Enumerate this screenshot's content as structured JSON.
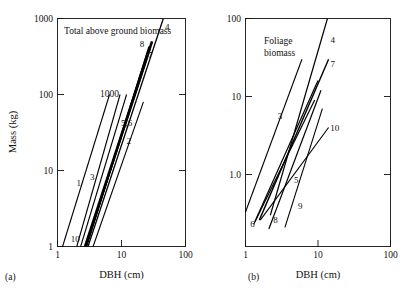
{
  "figure": {
    "panels": [
      {
        "tag": "(a)",
        "annotation": "Total above ground biomass",
        "extra_annotation": "1000",
        "xlabel": "DBH (cm)",
        "ylabel": "Mass (kg)",
        "xticks": [
          "1",
          "10",
          "100"
        ],
        "yticks": [
          "1000",
          "100",
          "10",
          "1"
        ]
      },
      {
        "tag": "(b)",
        "annotation_line1": "Foliage",
        "annotation_line2": "biomass",
        "xlabel": "DBH (cm)",
        "xticks": [
          "1",
          "10",
          "100"
        ],
        "yticks": [
          "100",
          "10",
          "1.0"
        ]
      }
    ]
  },
  "chart_data": [
    {
      "type": "line",
      "panel": "(a)",
      "title": "Total above ground biomass",
      "xlabel": "DBH (cm)",
      "ylabel": "Mass (kg)",
      "xscale": "log",
      "yscale": "log",
      "xlim": [
        1,
        100
      ],
      "ylim": [
        1,
        1000
      ],
      "grid": false,
      "legend": "inline-numeric-labels",
      "annotations": [
        {
          "text": "Total above ground biomass",
          "x": 1.35,
          "y": 620
        },
        {
          "text": "1000",
          "x": 4.0,
          "y": 105
        }
      ],
      "series": [
        {
          "name": "1",
          "label_x": 2.15,
          "label_y": 6.2,
          "points": [
            [
              1.2,
              1.0
            ],
            [
              6.5,
              100.0
            ]
          ]
        },
        {
          "name": "2",
          "label_x": 13.0,
          "label_y": 22.0,
          "points": [
            [
              3.6,
              1.0
            ],
            [
              22.0,
              80.0
            ]
          ]
        },
        {
          "name": "3",
          "label_x": 3.5,
          "label_y": 7.5,
          "points": [
            [
              2.3,
              1.0
            ],
            [
              12.0,
              100.0
            ]
          ]
        },
        {
          "name": "4",
          "label_x": 52.0,
          "label_y": 700.0,
          "points": [
            [
              3.0,
              1.0
            ],
            [
              45.0,
              1000.0
            ]
          ]
        },
        {
          "name": "5,6",
          "label_x": 12.0,
          "label_y": 38.0,
          "points": [
            [
              2.7,
              1.0
            ],
            [
              30.0,
              500.0
            ]
          ]
        },
        {
          "name": "7",
          "label_x": 28.0,
          "label_y": 300.0,
          "points": [
            [
              2.75,
              1.0
            ],
            [
              28.0,
              400.0
            ]
          ]
        },
        {
          "name": "8",
          "label_x": 21.0,
          "label_y": 420.0,
          "points": [
            [
              2.8,
              1.0
            ],
            [
              27.0,
              430.0
            ]
          ]
        },
        {
          "name": "9",
          "label_x": null,
          "label_y": null,
          "points": [
            [
              2.85,
              1.0
            ],
            [
              26.0,
              380.0
            ]
          ]
        },
        {
          "name": "10",
          "label_x": 1.9,
          "label_y": 1.15,
          "points": [
            [
              2.0,
              1.0
            ],
            [
              9.5,
              100.0
            ]
          ]
        }
      ]
    },
    {
      "type": "line",
      "panel": "(b)",
      "title": "Foliage biomass",
      "xlabel": "DBH (cm)",
      "ylabel": "",
      "xscale": "log",
      "yscale": "log",
      "xlim": [
        1,
        100
      ],
      "ylim": [
        0.18,
        100
      ],
      "grid": false,
      "legend": "inline-numeric-labels",
      "annotations": [
        {
          "text": "Foliage",
          "x": 1.7,
          "y": 46
        },
        {
          "text": "biomass",
          "x": 1.7,
          "y": 31
        }
      ],
      "series": [
        {
          "name": "3",
          "label_x": 3.0,
          "label_y": 5.2,
          "points": [
            [
              1.0,
              0.33
            ],
            [
              6.0,
              30.0
            ]
          ]
        },
        {
          "name": "4",
          "label_x": 16.0,
          "label_y": 48.0,
          "points": [
            [
              2.2,
              0.3
            ],
            [
              13.5,
              100.0
            ]
          ]
        },
        {
          "name": "5",
          "label_x": 5.0,
          "label_y": 0.78,
          "points": [
            [
              1.3,
              0.23
            ],
            [
              9.0,
              9.0
            ]
          ]
        },
        {
          "name": "6",
          "label_x": 1.25,
          "label_y": 0.215,
          "points": [
            [
              1.35,
              0.25
            ],
            [
              10.0,
              16.0
            ]
          ]
        },
        {
          "name": "7",
          "label_x": 16.0,
          "label_y": 24.0,
          "points": [
            [
              1.55,
              0.26
            ],
            [
              14.0,
              30.0
            ]
          ]
        },
        {
          "name": "8",
          "label_x": 2.6,
          "label_y": 0.24,
          "points": [
            [
              2.1,
              0.2
            ],
            [
              11.0,
              12.0
            ]
          ]
        },
        {
          "name": "9",
          "label_x": 5.7,
          "label_y": 0.36,
          "points": [
            [
              3.5,
              0.21
            ],
            [
              11.5,
              7.0
            ]
          ]
        },
        {
          "name": "10",
          "label_x": 17.0,
          "label_y": 3.6,
          "points": [
            [
              1.6,
              0.26
            ],
            [
              14.0,
              4.0
            ]
          ]
        }
      ]
    }
  ]
}
